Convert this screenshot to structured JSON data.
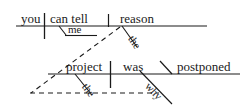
{
  "diagram": {
    "type": "reed-kellogg-sentence-diagram",
    "sentence": "Can you tell me the reason why the project was postponed?",
    "ink_color": "#1a1a1a",
    "background_color": "#ffffff",
    "clauses": [
      {
        "id": "main-clause",
        "baseline_y": 26,
        "words": [
          {
            "id": "subject",
            "role": "subject",
            "text": "you"
          },
          {
            "id": "verb",
            "role": "verb",
            "text": "can tell"
          },
          {
            "id": "indirect-object",
            "role": "indirect-object",
            "text": "me"
          },
          {
            "id": "direct-object",
            "role": "direct-object",
            "text": "reason"
          },
          {
            "id": "article-reason",
            "role": "modifier-article",
            "text": "the"
          }
        ]
      },
      {
        "id": "subordinate-clause",
        "baseline_y": 74,
        "words": [
          {
            "id": "sub-subject",
            "role": "subject",
            "text": "project"
          },
          {
            "id": "sub-article",
            "role": "modifier-article",
            "text": "the"
          },
          {
            "id": "sub-verb",
            "role": "linking-verb",
            "text": "was"
          },
          {
            "id": "sub-complement",
            "role": "subject-complement",
            "text": "postponed"
          },
          {
            "id": "sub-connector",
            "role": "relative-adverb",
            "text": "why"
          }
        ]
      }
    ],
    "connector": {
      "style": "dashed",
      "label": "why",
      "description": "dashed triangle linking the subordinate clause to the noun 'reason'"
    }
  }
}
